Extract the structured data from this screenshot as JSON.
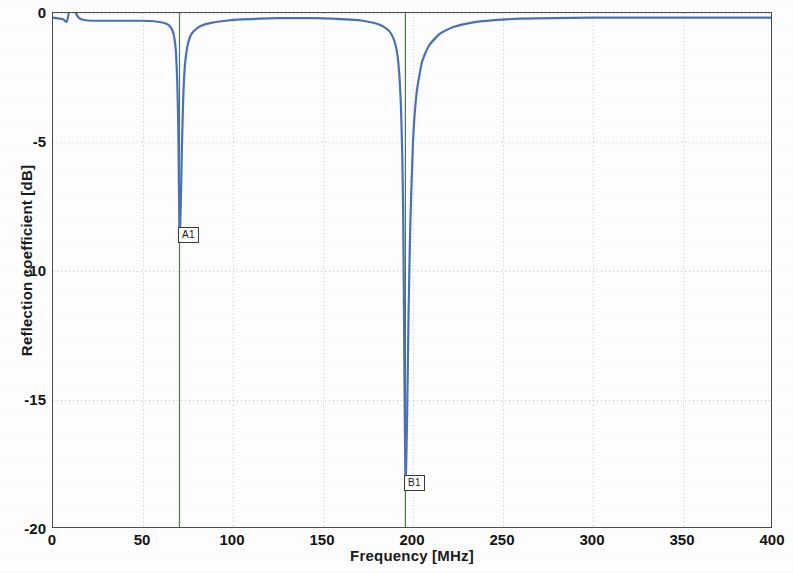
{
  "chart_data": {
    "type": "line",
    "title": "",
    "xlabel": "Frequency [MHz]",
    "ylabel": "Reflection coefficient [dB]",
    "xlim": [
      0,
      400
    ],
    "ylim": [
      -20,
      0
    ],
    "xticks": [
      0,
      50,
      100,
      150,
      200,
      250,
      300,
      350,
      400
    ],
    "xtick_labels": [
      "0",
      "50",
      "100",
      "150",
      "200",
      "250",
      "300",
      "350",
      "400"
    ],
    "yticks": [
      0,
      -5,
      -10,
      -15,
      -20
    ],
    "ytick_labels": [
      "0",
      "-5",
      "-10",
      "-15",
      "-20"
    ],
    "grid": true,
    "legend": "none",
    "series": [
      {
        "name": "Reflection coefficient",
        "color": "#4a72b8",
        "line_width": 2.2,
        "x": [
          0,
          2,
          4,
          6,
          7.5,
          8.5,
          9.5,
          10.5,
          11.5,
          13,
          15,
          18,
          22,
          28,
          35,
          42,
          50,
          56,
          60,
          63,
          65,
          66.5,
          67.5,
          68.3,
          69,
          69.5,
          69.8,
          70,
          70.2,
          70.5,
          71,
          71.6,
          72.3,
          73.2,
          74.5,
          76,
          78,
          82,
          88,
          96,
          105,
          115,
          125,
          135,
          145,
          155,
          165,
          172,
          178,
          183,
          186,
          188,
          190,
          191.5,
          192.5,
          193.3,
          194,
          194.5,
          194.9,
          195.2,
          195.5,
          195.8,
          196.2,
          196.8,
          197.5,
          198.5,
          200,
          202,
          205,
          209,
          215,
          222,
          232,
          245,
          260,
          278,
          298,
          320,
          345,
          370,
          400
        ],
        "y": [
          -0.18,
          -0.2,
          -0.22,
          -0.26,
          -0.35,
          -0.1,
          0.32,
          0.55,
          0.3,
          -0.05,
          -0.22,
          -0.28,
          -0.3,
          -0.3,
          -0.3,
          -0.3,
          -0.3,
          -0.32,
          -0.36,
          -0.42,
          -0.52,
          -0.7,
          -1.0,
          -1.5,
          -2.6,
          -4.0,
          -5.6,
          -7.0,
          -8.2,
          -8.55,
          -7.4,
          -5.3,
          -3.4,
          -2.1,
          -1.35,
          -0.95,
          -0.72,
          -0.5,
          -0.38,
          -0.3,
          -0.25,
          -0.22,
          -0.2,
          -0.2,
          -0.2,
          -0.22,
          -0.26,
          -0.3,
          -0.38,
          -0.5,
          -0.65,
          -0.82,
          -1.15,
          -1.7,
          -2.5,
          -3.6,
          -5.4,
          -7.6,
          -10.8,
          -13.6,
          -16.2,
          -17.9,
          -17.6,
          -15.3,
          -11.8,
          -8.2,
          -5.0,
          -3.1,
          -1.9,
          -1.25,
          -0.8,
          -0.55,
          -0.38,
          -0.28,
          -0.22,
          -0.2,
          -0.18,
          -0.18,
          -0.18,
          -0.18,
          -0.18
        ]
      }
    ],
    "markers": [
      {
        "label": "A1",
        "x": 70,
        "y": -8.55,
        "cursor_color": "#4c7a4c",
        "cursor_line": true,
        "box_x": 178,
        "box_y": 227
      },
      {
        "label": "B1",
        "x": 195.5,
        "y": -17.9,
        "cursor_color": "#4c7a4c",
        "cursor_line": true,
        "box_x": 404,
        "box_y": 475
      }
    ],
    "colors": {
      "curve": "#4a72b8",
      "grid": "#c8c8c8",
      "frame": "#4d4d4d",
      "cursor": "#4c7a4c",
      "background": "#ffffff",
      "text": "#141414"
    }
  }
}
